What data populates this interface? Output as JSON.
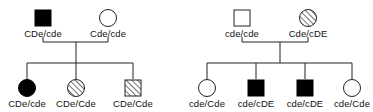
{
  "diagram": {
    "type": "pedigree",
    "colors": {
      "line": "#222222",
      "affected_fill": "#000000",
      "unaffected_fill": "#ffffff",
      "hatch": "#333333"
    },
    "families": [
      {
        "id": "family-1",
        "parents": [
          {
            "role": "father",
            "shape": "square",
            "fill": "solid",
            "genotype": "CDe/cde"
          },
          {
            "role": "mother",
            "shape": "circle",
            "fill": "empty",
            "genotype": "Cde/cde"
          }
        ],
        "children": [
          {
            "sex": "female",
            "shape": "circle",
            "fill": "solid",
            "genotype": "CDe/cde"
          },
          {
            "sex": "female",
            "shape": "circle",
            "fill": "hatched",
            "genotype": "CDe/Cde"
          },
          {
            "sex": "male",
            "shape": "square",
            "fill": "hatched",
            "genotype": "CDe/Cde"
          }
        ]
      },
      {
        "id": "family-2",
        "parents": [
          {
            "role": "father",
            "shape": "square",
            "fill": "empty",
            "genotype": "cde/cde"
          },
          {
            "role": "mother",
            "shape": "circle",
            "fill": "hatched",
            "genotype": "Cde/cDE"
          }
        ],
        "children": [
          {
            "sex": "female",
            "shape": "circle",
            "fill": "empty",
            "genotype": "cde/Cde"
          },
          {
            "sex": "male",
            "shape": "square",
            "fill": "solid",
            "genotype": "cde/cDE"
          },
          {
            "sex": "male",
            "shape": "square",
            "fill": "solid",
            "genotype": "cde/cDE"
          },
          {
            "sex": "female",
            "shape": "circle",
            "fill": "empty",
            "genotype": "cde/Cde"
          }
        ]
      }
    ]
  }
}
